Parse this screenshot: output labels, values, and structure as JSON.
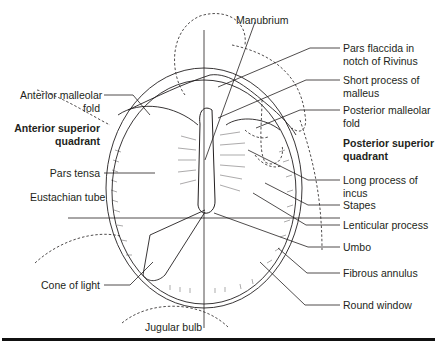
{
  "diagram": {
    "labels_left": [
      {
        "id": "anterior_malleolar_fold",
        "lines": [
          "Anterior malleolar",
          "fold"
        ],
        "bold": false
      },
      {
        "id": "anterior_superior_quadrant",
        "lines": [
          "Anterior superior",
          "quadrant"
        ],
        "bold": true
      },
      {
        "id": "pars_tensa",
        "lines": [
          "Pars tensa"
        ],
        "bold": false
      },
      {
        "id": "eustachian_tube",
        "lines": [
          "Eustachian tube"
        ],
        "bold": false
      },
      {
        "id": "cone_of_light",
        "lines": [
          "Cone of light"
        ],
        "bold": false
      }
    ],
    "labels_top": [
      {
        "id": "manubrium",
        "lines": [
          "Manubrium"
        ],
        "bold": false
      }
    ],
    "labels_bottom": [
      {
        "id": "jugular_bulb",
        "lines": [
          "Jugular bulb"
        ],
        "bold": false
      }
    ],
    "labels_right": [
      {
        "id": "pars_flaccida",
        "lines": [
          "Pars flaccida in",
          "notch of Rivinus"
        ],
        "bold": false
      },
      {
        "id": "short_process_malleus",
        "lines": [
          "Short process of",
          "malleus"
        ],
        "bold": false
      },
      {
        "id": "posterior_malleolar_fold",
        "lines": [
          "Posterior malleolar",
          "fold"
        ],
        "bold": false
      },
      {
        "id": "posterior_superior_quadrant",
        "lines": [
          "Posterior superior",
          "quadrant"
        ],
        "bold": true
      },
      {
        "id": "long_process_incus",
        "lines": [
          "Long process of",
          "incus"
        ],
        "bold": false
      },
      {
        "id": "stapes",
        "lines": [
          "Stapes"
        ],
        "bold": false
      },
      {
        "id": "lenticular_process",
        "lines": [
          "Lenticular process"
        ],
        "bold": false
      },
      {
        "id": "umbo",
        "lines": [
          "Umbo"
        ],
        "bold": false
      },
      {
        "id": "fibrous_annulus",
        "lines": [
          "Fibrous annulus"
        ],
        "bold": false
      },
      {
        "id": "round_window",
        "lines": [
          "Round window"
        ],
        "bold": false
      }
    ],
    "colors": {
      "ink": "#231f20",
      "background": "#ffffff"
    }
  }
}
